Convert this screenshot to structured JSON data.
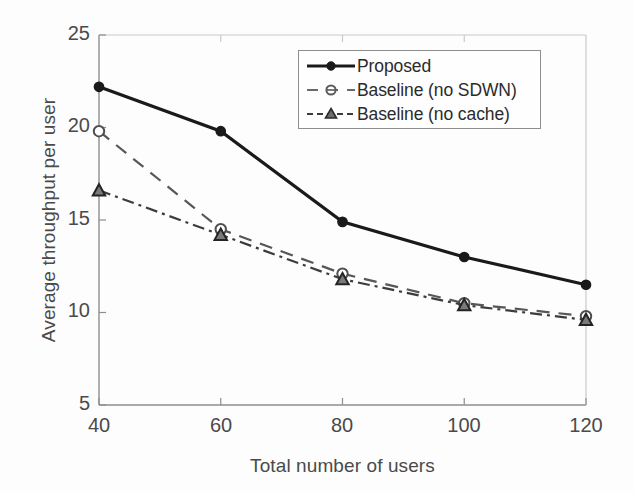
{
  "chart_data": {
    "type": "line",
    "title": "",
    "xlabel": "Total number of users",
    "ylabel": "Average throughput per user",
    "x": [
      40,
      60,
      80,
      100,
      120
    ],
    "xticklabels": [
      "40",
      "60",
      "80",
      "100",
      "120"
    ],
    "yticklabels": [
      "5",
      "10",
      "15",
      "20",
      "25"
    ],
    "xlim": [
      40,
      120
    ],
    "ylim": [
      5,
      25
    ],
    "grid": false,
    "legend_position": "upper right",
    "series": [
      {
        "name": "Proposed",
        "values": [
          22.2,
          19.8,
          14.9,
          13.0,
          11.5
        ],
        "linestyle": "solid",
        "marker": "filled-circle",
        "color": "#1a1a1a"
      },
      {
        "name": "Baseline (no SDWN)",
        "values": [
          19.8,
          14.5,
          12.1,
          10.5,
          9.8
        ],
        "linestyle": "dashed",
        "marker": "open-circle",
        "color": "#575757"
      },
      {
        "name": "Baseline (no cache)",
        "values": [
          16.6,
          14.2,
          11.8,
          10.4,
          9.6
        ],
        "linestyle": "dashdot",
        "marker": "filled-triangle",
        "color": "#3c3c3c"
      }
    ]
  },
  "axes": {
    "y_ticks": [
      {
        "label": "25"
      },
      {
        "label": "20"
      },
      {
        "label": "15"
      },
      {
        "label": "10"
      },
      {
        "label": "5"
      }
    ],
    "x_ticks": [
      {
        "label": "40"
      },
      {
        "label": "60"
      },
      {
        "label": "80"
      },
      {
        "label": "100"
      },
      {
        "label": "120"
      }
    ],
    "xlabel": "Total number of users",
    "ylabel": "Average throughput per user"
  },
  "legend": {
    "entries": [
      {
        "label": "Proposed"
      },
      {
        "label": "Baseline (no SDWN)"
      },
      {
        "label": "Baseline (no cache)"
      }
    ]
  },
  "colors": {
    "axis": "#8e8e8e",
    "text": "#4a4a4a",
    "series_proposed": "#1a1a1a",
    "series_no_sdwn": "#575757",
    "series_no_cache": "#3c3c3c",
    "background": "#fdfdfd"
  }
}
